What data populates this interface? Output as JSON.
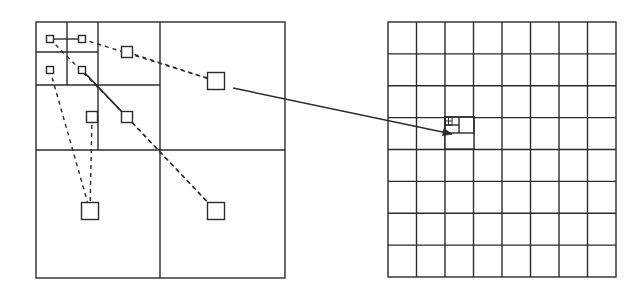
{
  "figure": {
    "background": "#ffffff",
    "stroke_color": "#2b2b2b",
    "line_width": 1.4,
    "width": 640,
    "height": 295
  },
  "left_panel": {
    "name": "quadtree-panel",
    "bounds": {
      "x": 36,
      "y": 22,
      "w": 249,
      "h": 256
    },
    "subdivision_lines": [
      {
        "orient": "v",
        "x": 160,
        "y1": 22,
        "y2": 150
      },
      {
        "orient": "h",
        "y": 150,
        "x1": 36,
        "x2": 285
      },
      {
        "orient": "v",
        "x": 160,
        "y1": 150,
        "y2": 278
      },
      {
        "orient": "h",
        "y": 85,
        "x1": 36,
        "x2": 160
      },
      {
        "orient": "v",
        "x": 98,
        "y1": 22,
        "y2": 150
      },
      {
        "orient": "h",
        "y": 52,
        "x1": 36,
        "x2": 98
      },
      {
        "orient": "v",
        "x": 67,
        "y1": 22,
        "y2": 85
      }
    ],
    "nodes": [
      {
        "id": "n1",
        "cx": 50,
        "cy": 39,
        "size": 7,
        "label": "leaf-level-4-a"
      },
      {
        "id": "n2",
        "cx": 82,
        "cy": 39,
        "size": 7,
        "label": "leaf-level-4-b"
      },
      {
        "id": "n3",
        "cx": 50,
        "cy": 70,
        "size": 7,
        "label": "leaf-level-4-c"
      },
      {
        "id": "n4",
        "cx": 82,
        "cy": 70,
        "size": 7,
        "label": "leaf-level-4-d"
      },
      {
        "id": "n5",
        "cx": 127,
        "cy": 52,
        "size": 11,
        "label": "leaf-level-3-a"
      },
      {
        "id": "n6",
        "cx": 92,
        "cy": 117,
        "size": 11,
        "label": "leaf-level-3-b"
      },
      {
        "id": "n7",
        "cx": 127,
        "cy": 117,
        "size": 11,
        "label": "leaf-level-3-c"
      },
      {
        "id": "n8",
        "cx": 216,
        "cy": 81,
        "size": 17,
        "label": "leaf-level-2-ne"
      },
      {
        "id": "n9",
        "cx": 90,
        "cy": 211,
        "size": 17,
        "label": "leaf-level-2-sw"
      },
      {
        "id": "n10",
        "cx": 216,
        "cy": 211,
        "size": 17,
        "label": "leaf-level-2-se"
      }
    ],
    "dashed_links": [
      {
        "from": "n1",
        "to": "n7"
      },
      {
        "from": "n2",
        "to": "n8"
      },
      {
        "from": "n3",
        "to": "n9"
      },
      {
        "from": "n4",
        "to": "n10"
      },
      {
        "from": "n5",
        "to": "n8"
      },
      {
        "from": "n6",
        "to": "n9"
      },
      {
        "from": "n7",
        "to": "n10"
      }
    ],
    "solid_links": [
      {
        "from": "n1",
        "to": "n2"
      },
      {
        "from": "n4",
        "to": "n7"
      }
    ]
  },
  "right_panel": {
    "name": "uniform-grid-panel",
    "bounds": {
      "x": 388,
      "y": 22,
      "w": 228,
      "h": 255
    },
    "columns": 8,
    "rows": 8,
    "refined_cell": {
      "col": 3,
      "row": 3
    },
    "refinement": {
      "outer": {
        "x": 445,
        "y": 117,
        "w": 29,
        "h": 32
      },
      "mid": {
        "x": 445,
        "y": 117,
        "w": 29,
        "h": 16
      },
      "inner_v": 459,
      "inner_h": 125,
      "micro": {
        "x": 445,
        "y": 117,
        "w": 7,
        "h": 8
      }
    }
  },
  "arrow": {
    "name": "pointer-arrow",
    "from": {
      "x": 233,
      "y": 88
    },
    "to": {
      "x": 452,
      "y": 134
    },
    "head_size": 9
  }
}
